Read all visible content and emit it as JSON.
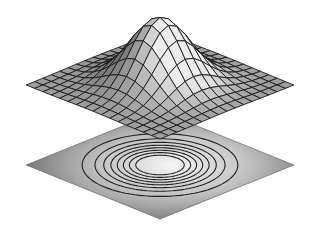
{
  "chart_data": {
    "type": "surface3d",
    "title": "",
    "subtitle": "",
    "xlabel": "",
    "ylabel": "",
    "zlabel": "",
    "function": "z = exp(-(x^2 + y^2)/2)",
    "x_range": [
      -3,
      3
    ],
    "y_range": [
      -3,
      3
    ],
    "z_range": [
      0,
      1
    ],
    "mesh_lines_per_axis": 16,
    "contour_levels": [
      0.1,
      0.2,
      0.3,
      0.4,
      0.5,
      0.6,
      0.7,
      0.8
    ],
    "grid": false,
    "legend": null,
    "axes_visible": false,
    "colors": {
      "surface_light": "#e8e8e8",
      "surface_dark": "#7a7a7a",
      "mesh_line": "#1a1a1a",
      "contour_line": "#202020",
      "plane_center": "#f4f4f4",
      "plane_edge": "#6e6e6e",
      "background": "#ffffff"
    }
  }
}
